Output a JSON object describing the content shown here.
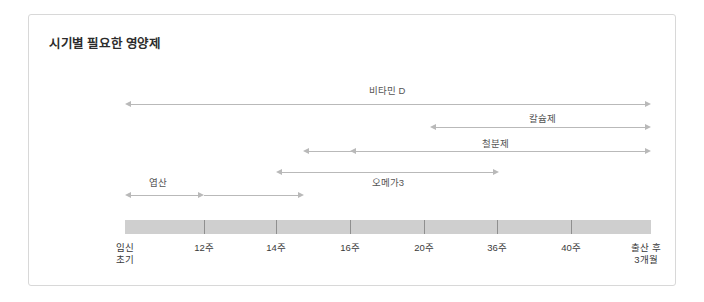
{
  "card": {
    "title": "시기별 필요한 영양제"
  },
  "timeline": {
    "axis_labels": [
      {
        "text": "임신\n초기",
        "x": 96
      },
      {
        "text": "12주",
        "x": 175
      },
      {
        "text": "14주",
        "x": 247
      },
      {
        "text": "16주",
        "x": 321
      },
      {
        "text": "20주",
        "x": 395
      },
      {
        "text": "36주",
        "x": 468
      },
      {
        "text": "40주",
        "x": 542
      },
      {
        "text": "출산 후\n3개월",
        "x": 617
      }
    ],
    "tick_positions": [
      175,
      247,
      321,
      395,
      468,
      542
    ],
    "track": {
      "x": 96,
      "y": 205,
      "width": 526,
      "height": 14
    },
    "track_color": "#cfcfcf"
  },
  "bars": [
    {
      "name": "vitamin-d",
      "label": "비타민 D",
      "label_x": 358,
      "label_y": 68,
      "line_y": 89,
      "start_x": 96,
      "end_x": 622,
      "left_arrow": true,
      "right_arrow": true
    },
    {
      "name": "calcium",
      "label": "칼슘제",
      "label_x": 513,
      "label_y": 96,
      "line_y": 112,
      "start_x": 401,
      "end_x": 622,
      "left_arrow": true,
      "right_arrow": true
    },
    {
      "name": "iron",
      "label": "철분제",
      "label_x": 466,
      "label_y": 121,
      "line_y": 136,
      "start_x": 274,
      "end_x": 622,
      "left_arrow": true,
      "right_arrow": true
    },
    {
      "name": "iron-secondary",
      "label": "",
      "label_x": 0,
      "label_y": 0,
      "line_y": 136,
      "start_x": 321,
      "end_x": 401,
      "left_arrow": true,
      "right_arrow": false
    },
    {
      "name": "omega3",
      "label": "오메가3",
      "label_x": 359,
      "label_y": 160,
      "line_y": 157,
      "start_x": 247,
      "end_x": 470,
      "left_arrow": true,
      "right_arrow": true
    },
    {
      "name": "folic-acid",
      "label": "엽산",
      "label_x": 129,
      "label_y": 160,
      "line_y": 180,
      "start_x": 96,
      "end_x": 175,
      "left_arrow": true,
      "right_arrow": true
    },
    {
      "name": "folic-acid-extended",
      "label": "",
      "label_x": 0,
      "label_y": 0,
      "line_y": 180,
      "start_x": 175,
      "end_x": 275,
      "left_arrow": false,
      "right_arrow": true
    }
  ],
  "colors": {
    "line": "#b9b9b9",
    "track": "#cfcfcf",
    "border": "#d8d8d8",
    "title": "#2b2b2b",
    "label": "#555555",
    "axis": "#3a3a3a"
  }
}
